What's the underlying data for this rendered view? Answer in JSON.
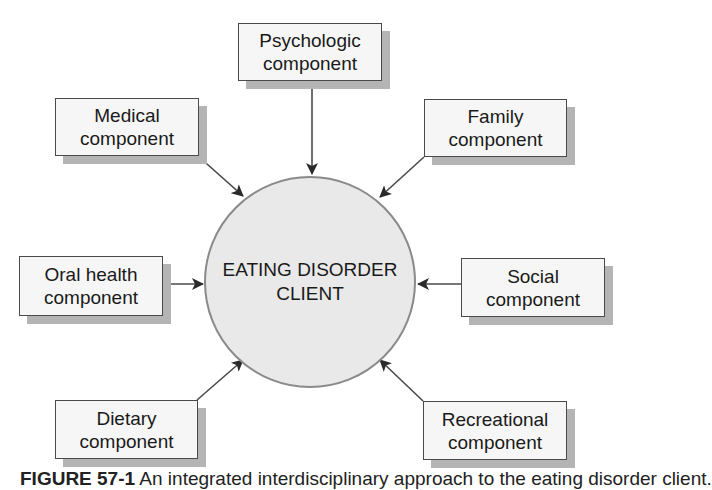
{
  "center": {
    "line1": "EATING DISORDER",
    "line2": "CLIENT"
  },
  "components": [
    {
      "id": "psychologic",
      "line1": "Psychologic",
      "line2": "component",
      "x": 238,
      "y": 23,
      "w": 144,
      "h": 58
    },
    {
      "id": "medical",
      "line1": "Medical",
      "line2": "component",
      "x": 55,
      "y": 98,
      "w": 144,
      "h": 58
    },
    {
      "id": "family",
      "line1": "Family",
      "line2": "component",
      "x": 424,
      "y": 99,
      "w": 143,
      "h": 58
    },
    {
      "id": "oral-health",
      "line1": "Oral health",
      "line2": "component",
      "x": 19,
      "y": 256,
      "w": 144,
      "h": 60
    },
    {
      "id": "social",
      "line1": "Social",
      "line2": "component",
      "x": 461,
      "y": 258,
      "w": 144,
      "h": 59
    },
    {
      "id": "dietary",
      "line1": "Dietary",
      "line2": "component",
      "x": 55,
      "y": 400,
      "w": 143,
      "h": 59
    },
    {
      "id": "recreational",
      "line1": "Recreational",
      "line2": "component",
      "x": 423,
      "y": 401,
      "w": 144,
      "h": 59
    }
  ],
  "caption": {
    "label": "FIGURE 57-1",
    "text": "An integrated interdisciplinary approach to the eating disorder client."
  },
  "colors": {
    "circle_fill": "#e9e9e9",
    "box_fill": "#f6f6f6",
    "shadow": "#b4b4b4",
    "arrow": "#333333"
  }
}
